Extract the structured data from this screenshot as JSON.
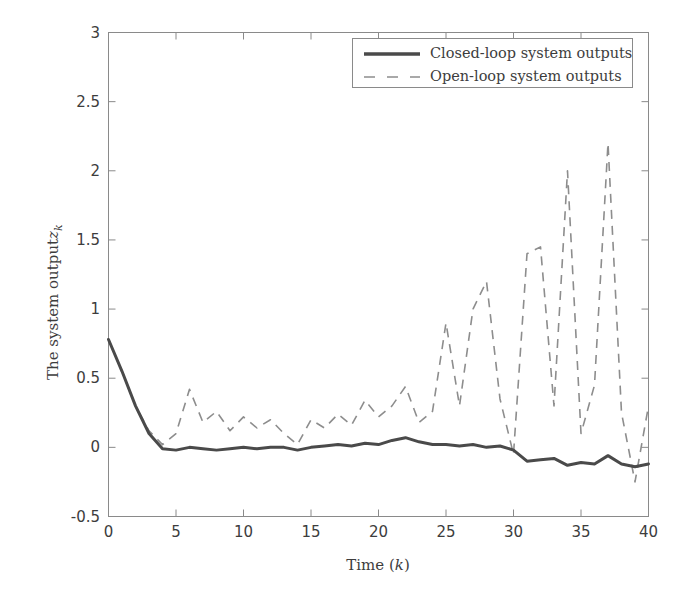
{
  "chart_data": {
    "type": "line",
    "title": "",
    "xlabel": "Time (k)",
    "ylabel": "The system output z_k",
    "ylabel_base": "The system output",
    "ylabel_var": "z",
    "ylabel_sub": "k",
    "xlabel_base": "Time (",
    "xlabel_var": "k",
    "xlabel_close": ")",
    "xlim": [
      0,
      40
    ],
    "ylim": [
      -0.5,
      3
    ],
    "xticks": [
      0,
      5,
      10,
      15,
      20,
      25,
      30,
      35,
      40
    ],
    "xtick_labels": [
      "0",
      "5",
      "10",
      "15",
      "20",
      "25",
      "30",
      "35",
      "40"
    ],
    "yticks": [
      -0.5,
      0,
      0.5,
      1,
      1.5,
      2,
      2.5,
      3
    ],
    "ytick_labels": [
      "-0.5",
      "0",
      "0.5",
      "1",
      "1.5",
      "2",
      "2.5",
      "3"
    ],
    "grid": false,
    "legend_position": "top-center",
    "line_color_closed": "#4a4a4a",
    "line_color_open": "#8d8d8d",
    "axis_color": "#8a8a8a",
    "background": "#ffffff",
    "x": [
      0,
      1,
      2,
      3,
      4,
      5,
      6,
      7,
      8,
      9,
      10,
      11,
      12,
      13,
      14,
      15,
      16,
      17,
      18,
      19,
      20,
      21,
      22,
      23,
      24,
      25,
      26,
      27,
      28,
      29,
      30,
      31,
      32,
      33,
      34,
      35,
      36,
      37,
      38,
      39,
      40
    ],
    "series": [
      {
        "name": "Closed-loop system outputs",
        "style": "solid",
        "color": "#4a4a4a",
        "width": 3,
        "values": [
          0.78,
          0.55,
          0.3,
          0.1,
          -0.01,
          -0.02,
          0.0,
          -0.01,
          -0.02,
          -0.01,
          0.0,
          -0.01,
          0.0,
          0.0,
          -0.02,
          0.0,
          0.01,
          0.02,
          0.01,
          0.03,
          0.02,
          0.05,
          0.07,
          0.04,
          0.02,
          0.02,
          0.01,
          0.02,
          0.0,
          0.01,
          -0.02,
          -0.1,
          -0.09,
          -0.08,
          -0.13,
          -0.11,
          -0.12,
          -0.06,
          -0.12,
          -0.14,
          -0.12
        ]
      },
      {
        "name": "Open-loop system outputs",
        "style": "dashed",
        "color": "#8d8d8d",
        "width": 1.6,
        "values": [
          0.78,
          0.55,
          0.3,
          0.12,
          0.02,
          0.1,
          0.42,
          0.18,
          0.26,
          0.12,
          0.22,
          0.14,
          0.2,
          0.1,
          0.02,
          0.2,
          0.14,
          0.24,
          0.16,
          0.34,
          0.22,
          0.3,
          0.44,
          0.18,
          0.26,
          0.9,
          0.3,
          1.0,
          1.2,
          0.35,
          -0.05,
          1.4,
          1.45,
          0.3,
          2.0,
          0.1,
          0.45,
          2.2,
          0.25,
          -0.25,
          0.3
        ]
      }
    ],
    "annotations": []
  },
  "legend": {
    "items": [
      {
        "label": "Closed-loop system outputs",
        "style": "solid"
      },
      {
        "label": "Open-loop system outputs",
        "style": "dashed"
      }
    ]
  }
}
